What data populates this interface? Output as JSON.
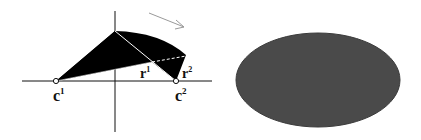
{
  "figure": {
    "left_panel": {
      "description": "Filled region bounded by arc and lines between centers c1 and c2, with radius lines r1 and r2",
      "labels": {
        "c1_base": "c",
        "c1_sup": "1",
        "c2_base": "c",
        "c2_sup": "2",
        "r1_base": "r",
        "r1_sup": "1",
        "r2_base": "r",
        "r2_sup": "2"
      },
      "direction_arrow": "arrow-pointing-down-right",
      "fill_color": "#000000",
      "axis_color": "#111111"
    },
    "right_panel": {
      "description": "Filled dark gray ellipse",
      "fill_color": "#4a4a4a"
    }
  }
}
